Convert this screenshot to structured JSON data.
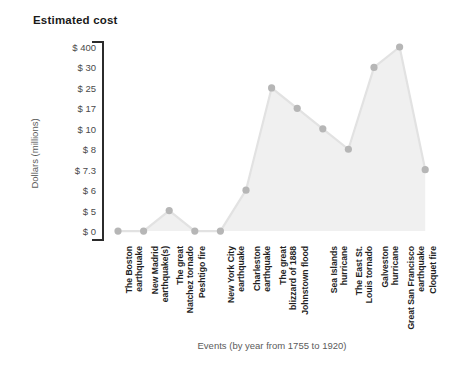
{
  "chart_data": {
    "type": "area",
    "title": "Estimated cost",
    "xlabel": "Events (by year from 1755 to 1920)",
    "ylabel": "Dollars (millions)",
    "grid": false,
    "legend": "none",
    "y_axis_scale": "ordinal-nonlinear",
    "ytick_labels": [
      "$ 400",
      "$ 30",
      "$ 25",
      "$ 17",
      "$ 10",
      "$ 8",
      "$ 7.3",
      "$ 6",
      "$ 5",
      "$ 0"
    ],
    "ytick_values": [
      400,
      30,
      25,
      17,
      10,
      8,
      7.3,
      6,
      5,
      0
    ],
    "categories": [
      "The Boston earthquake",
      "New Madrid earthquake(s)",
      "The great Natchez tornado",
      "Peshtigo fire",
      "New York City earthquake",
      "Charleston earthquake",
      "The great blizzard of 1888",
      "Johnstown flood",
      "Sea Islands hurricane",
      "The East St. Louis tornado",
      "Galveston hurricane",
      "Great San Francisco earthquake",
      "Cloquet fire"
    ],
    "values": [
      0,
      0,
      5,
      0,
      0,
      6,
      25,
      17,
      10,
      8,
      30,
      400,
      7.3
    ],
    "series_name": "Estimated cost",
    "marker_color": "#b6b6b6",
    "line_color": "#e2e2e2",
    "area_color": "#f0f0f0",
    "axis_color": "#2b2b2b"
  }
}
